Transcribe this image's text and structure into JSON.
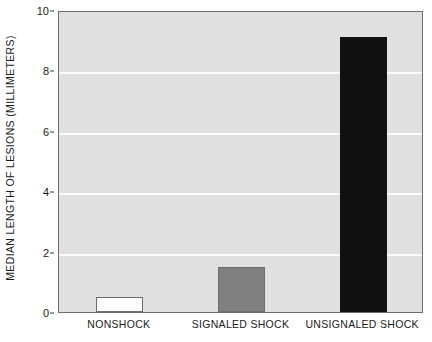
{
  "chart_data": {
    "type": "bar",
    "title": "",
    "xlabel": "",
    "ylabel": "MEDIAN LENGTH OF LESIONS (MILLIMETERS)",
    "categories": [
      "NONSHOCK",
      "SIGNALED SHOCK",
      "UNSIGNALED SHOCK"
    ],
    "values": [
      0.5,
      1.5,
      9.1
    ],
    "ylim": [
      0,
      10
    ],
    "yticks": [
      0,
      2,
      4,
      6,
      8,
      10
    ],
    "ytick_labels": [
      "0",
      "2",
      "4",
      "6",
      "8",
      "10"
    ],
    "grid": true,
    "grid_axis": "y",
    "legend": "none",
    "series": [
      {
        "name": "Median lesion length",
        "points": [
          {
            "category": "NONSHOCK",
            "value": 0.5,
            "fill": "#fdfdfd",
            "stroke": "#6e6e6e"
          },
          {
            "category": "SIGNALED SHOCK",
            "value": 1.5,
            "fill": "#808080",
            "stroke": "#6e6e6e"
          },
          {
            "category": "UNSIGNALED SHOCK",
            "value": 9.1,
            "fill": "#111111",
            "stroke": "#111111"
          }
        ]
      }
    ],
    "colors": {
      "plot_background": "#e0e0e0",
      "page_background": "#ffffff",
      "gridline": "#fafafa",
      "axis_border": "#6e6e6e",
      "text": "#1a1a1a"
    }
  }
}
